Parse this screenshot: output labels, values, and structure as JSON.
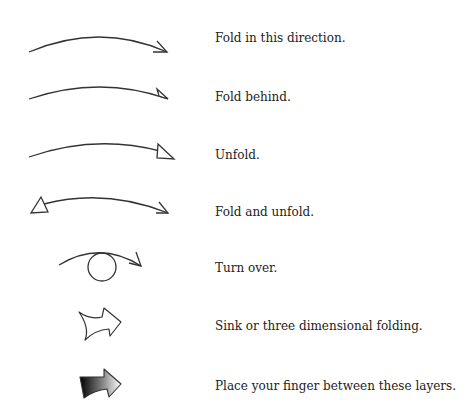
{
  "stroke_color": "#333333",
  "symbols": [
    {
      "id": "fold-in-this-direction",
      "label": "Fold in this direction.",
      "arrow": "valley-fold-arrow"
    },
    {
      "id": "fold-behind",
      "label": "Fold behind.",
      "arrow": "mountain-fold-arrow"
    },
    {
      "id": "unfold",
      "label": "Unfold.",
      "arrow": "unfold-arrow"
    },
    {
      "id": "fold-and-unfold",
      "label": "Fold and unfold.",
      "arrow": "fold-unfold-arrow"
    },
    {
      "id": "turn-over",
      "label": "Turn over.",
      "arrow": "turn-over-arrow"
    },
    {
      "id": "sink",
      "label": "Sink or three dimensional folding.",
      "arrow": "sink-arrow"
    },
    {
      "id": "place-finger",
      "label": "Place your finger between these layers.",
      "arrow": "finger-arrow"
    }
  ]
}
